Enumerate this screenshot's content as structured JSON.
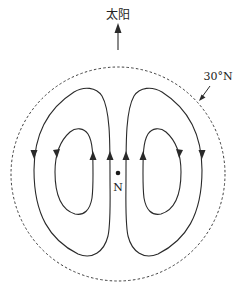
{
  "diagram": {
    "sun_label": "太阳",
    "latitude_label": "30°N",
    "pole_label": "N",
    "colors": {
      "stroke": "#2a2a2a",
      "background": "#ffffff"
    },
    "elements": {
      "boundary": "dashed circle at 30°N latitude",
      "sun_arrow": "arrow pointing up toward the sun",
      "loops": [
        {
          "side": "left",
          "ring": "outer",
          "direction": "counterclockwise"
        },
        {
          "side": "left",
          "ring": "inner",
          "direction": "counterclockwise"
        },
        {
          "side": "right",
          "ring": "inner",
          "direction": "clockwise"
        },
        {
          "side": "right",
          "ring": "outer",
          "direction": "clockwise"
        }
      ]
    }
  }
}
